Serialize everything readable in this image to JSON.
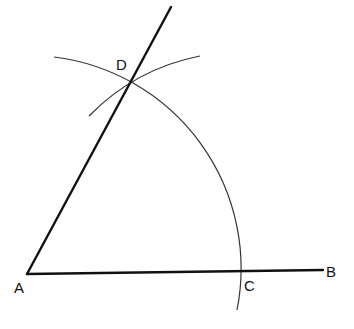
{
  "diagram": {
    "title": "",
    "colors": {
      "background": "#ffffff",
      "stroke": "#111111",
      "arc": "#333333"
    },
    "points": {
      "A": {
        "label": "A",
        "x": 27,
        "y": 274,
        "label_x": 14,
        "label_y": 293
      },
      "B": {
        "label": "B",
        "x": 323,
        "y": 270,
        "label_x": 326,
        "label_y": 277
      },
      "C": {
        "label": "C",
        "x": 240,
        "y": 271,
        "label_x": 244,
        "label_y": 291
      },
      "D": {
        "label": "D",
        "x": 129,
        "y": 84,
        "label_x": 116,
        "label_y": 70
      }
    },
    "segments": [
      {
        "name": "segment-AB",
        "from": "A",
        "to": "B"
      },
      {
        "name": "ray-AD",
        "from": "A",
        "through": "D",
        "end_x": 171,
        "end_y": 7
      }
    ],
    "arcs": [
      {
        "name": "arc-center-A",
        "center": "A",
        "radius": 213,
        "start": [
          54,
          57
        ],
        "end": [
          237,
          310
        ]
      },
      {
        "name": "arc-center-C",
        "center": "C",
        "radius": 213,
        "start": [
          89,
          116
        ],
        "end": [
          200,
          56
        ]
      }
    ]
  }
}
